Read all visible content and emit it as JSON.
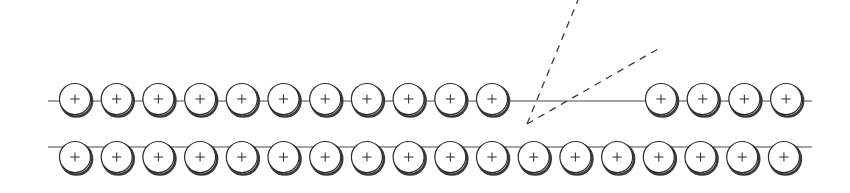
{
  "figure": {
    "canvas": {
      "width": 850,
      "height": 193,
      "background": "#ffffff"
    },
    "colors": {
      "bead_stroke": "#2f2f2f",
      "bead_fill": "#ffffff",
      "bead_shadow": "#3a3a3a",
      "plus_sign": "#3a3a3a",
      "rail": "#4a4a4a",
      "ray": "#3c3c3c"
    },
    "bead": {
      "symbol": "+",
      "radius": 15.5,
      "shadow_offset_x": 1.5,
      "shadow_offset_y": 2.0,
      "stroke_width": 1.2,
      "shadow_stroke_width": 2.6,
      "plus_arm": 4.6
    },
    "rows": [
      {
        "name": "upper-chain",
        "label": "upper chain",
        "center_y": 99,
        "rail_y": 101,
        "spacing": 41.7,
        "segments": [
          {
            "name": "upper-left-segment",
            "count": 11,
            "first_center_x": 75,
            "rail_start_x": 48,
            "rail_end_x": 527
          },
          {
            "name": "upper-right-segment",
            "count": 4,
            "first_center_x": 661,
            "rail_start_x": 527,
            "rail_end_x": 812
          }
        ]
      },
      {
        "name": "lower-chain",
        "label": "lower chain",
        "center_y": 157,
        "rail_y": 147,
        "spacing": 41.7,
        "segments": [
          {
            "name": "lower-full-segment",
            "count": 18,
            "first_center_x": 75,
            "rail_start_x": 48,
            "rail_end_x": 812
          }
        ]
      }
    ],
    "rays": [
      {
        "name": "steep-dashed-ray",
        "label": "steep dashed ray",
        "x1": 527,
        "y1": 124,
        "x2": 578,
        "y2": 0,
        "dash": "7 6",
        "stroke_width": 1.3
      },
      {
        "name": "shallow-dashed-ray",
        "label": "shallow dashed ray",
        "x1": 527,
        "y1": 124,
        "x2": 658,
        "y2": 49,
        "dash": "7 6",
        "stroke_width": 1.3
      }
    ],
    "vertex": {
      "name": "ray-convergence-point",
      "label": "ray convergence point",
      "x": 527,
      "y": 124
    }
  }
}
